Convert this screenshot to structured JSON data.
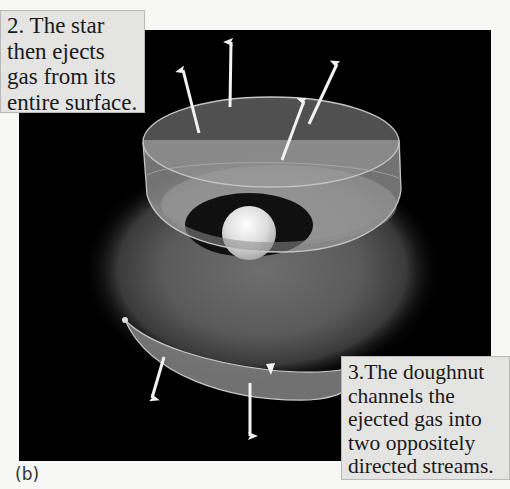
{
  "figure": {
    "panel_label": "(b)",
    "background_color": "#000000",
    "page_color": "#f7f7f5",
    "caption_box_color": "#e4e4e3",
    "elements": {
      "star": {
        "label": "star",
        "color": "#e8e8e8"
      },
      "doughnut": {
        "label": "doughnut (torus of gas)",
        "color": "#8a8a8a"
      },
      "upper_stream": {
        "label": "upper ejected gas stream",
        "arrow_count": 4,
        "direction": "up"
      },
      "lower_stream": {
        "label": "lower ejected gas stream",
        "arrow_count": 2,
        "direction": "down"
      }
    }
  },
  "captions": {
    "step2": {
      "text": "2. The star\nthen ejects\ngas from its\nentire surface."
    },
    "step3": {
      "text": "3.The doughnut\nchannels the\nejected gas into\ntwo oppositely\ndirected streams."
    }
  }
}
